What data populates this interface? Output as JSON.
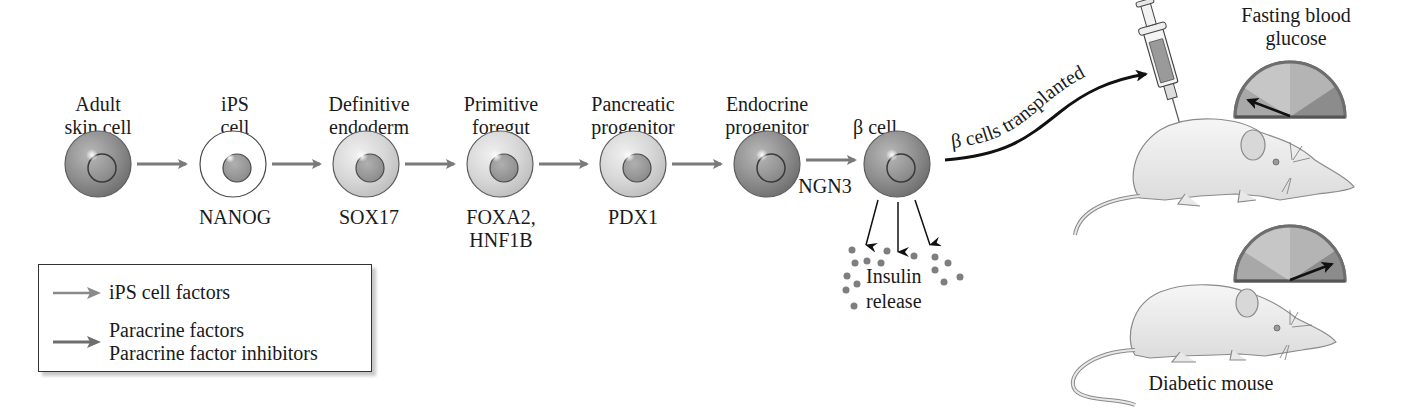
{
  "diagram": {
    "stages": [
      {
        "label_lines": [
          "Adult",
          "skin cell"
        ],
        "factor_lines": [],
        "shade": "dark"
      },
      {
        "label_lines": [
          "iPS",
          "cell"
        ],
        "factor_lines": [
          "NANOG"
        ],
        "shade": "white"
      },
      {
        "label_lines": [
          "Definitive",
          "endoderm"
        ],
        "factor_lines": [
          "SOX17"
        ],
        "shade": "light"
      },
      {
        "label_lines": [
          "Primitive",
          "foregut"
        ],
        "factor_lines": [
          "FOXA2,",
          "HNF1B"
        ],
        "shade": "light"
      },
      {
        "label_lines": [
          "Pancreatic",
          "progenitor"
        ],
        "factor_lines": [
          "PDX1"
        ],
        "shade": "light"
      },
      {
        "label_lines": [
          "Endocrine",
          "progenitor"
        ],
        "factor_lines": [],
        "shade": "dark"
      },
      {
        "label_lines": [
          "β cell"
        ],
        "factor_lines": [],
        "shade": "dark"
      }
    ],
    "arrow_factor_ngn3": "NGN3",
    "insulin_release": [
      "Insulin",
      "release"
    ],
    "transplant_label": "β cells transplanted",
    "gauge_title": [
      "Fasting blood",
      "glucose"
    ],
    "gauges": [
      {
        "name": "treated-mouse",
        "level": "low"
      },
      {
        "name": "diabetic-mouse",
        "level": "high"
      }
    ],
    "mouse_caption": "Diabetic mouse",
    "legend": {
      "items": [
        {
          "arrow": "light-gray-arrow",
          "lines": [
            "iPS cell factors"
          ]
        },
        {
          "arrow": "gray-arrow",
          "lines": [
            "Paracrine factors",
            "Paracrine factor inhibitors"
          ]
        }
      ]
    },
    "colors": {
      "dark_cell": "#8a8a8a",
      "light_cell": "#d4d4d4",
      "white_cell": "#ffffff",
      "nucleus": "#9a9a9a",
      "arrow_gray": "#7a7a7a",
      "gauge_rim": "#6e6e6e"
    }
  }
}
